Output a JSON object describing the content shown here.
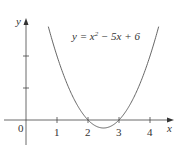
{
  "chart_data": {
    "type": "line",
    "title": "",
    "equation": "y = x² − 5x + 6",
    "equation_parts": {
      "lhs": "y = x",
      "sup": "2",
      "rhs": " − 5x + 6"
    },
    "xlabel": "x",
    "ylabel": "y",
    "origin_label": "0",
    "x_ticks": [
      "1",
      "2",
      "3",
      "4"
    ],
    "y_ticks_unlabeled": [
      1,
      2
    ],
    "xlim": [
      -0.8,
      4.4
    ],
    "ylim": [
      -0.8,
      3.2
    ],
    "grid": false,
    "series": [
      {
        "name": "y = x^2 - 5x + 6",
        "x": [
          0.72,
          1,
          1.5,
          2,
          2.5,
          3,
          3.5,
          4,
          4.28
        ],
        "y": [
          3.16,
          2,
          0.75,
          0,
          -0.25,
          0,
          0.75,
          2,
          3.16
        ]
      }
    ],
    "roots": [
      2,
      3
    ],
    "vertex": [
      2.5,
      -0.25
    ]
  }
}
